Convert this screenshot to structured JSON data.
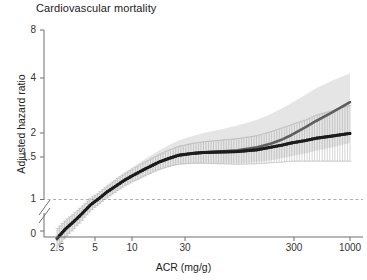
{
  "chart_data": {
    "type": "line",
    "title": "Cardiovascular mortality",
    "xlabel": "ACR (mg/g)",
    "ylabel": "Adjusted hazard ratio",
    "xscale": "log",
    "yscale": "log",
    "xlim": [
      2.0,
      1200
    ],
    "ylim": [
      0.45,
      8
    ],
    "xticks": [
      2.5,
      5,
      10,
      30,
      300,
      1000
    ],
    "xticklabels": [
      "2.5",
      "5",
      "10",
      "30",
      "300",
      "1000"
    ],
    "yticks": [
      0,
      1,
      1.5,
      2,
      4,
      8
    ],
    "yticklabels": [
      "0",
      "1",
      "1.5",
      "2",
      "4",
      "8"
    ],
    "axis_break": true,
    "grid": false,
    "reference_line": {
      "y": 1,
      "style": "dashed",
      "color": "#9a9a9a"
    },
    "legend": "none",
    "colors": {
      "primary_line": "#1c1c1c",
      "secondary_line": "#5e5e5e",
      "error_bars": "#9e9e9e",
      "confidence_band": "#dcdcdc",
      "axis": "#6f6f6f"
    },
    "x": [
      2.5,
      3,
      3.5,
      4,
      5,
      6,
      7,
      8,
      10,
      12,
      15,
      20,
      25,
      30,
      40,
      50,
      70,
      100,
      150,
      200,
      250,
      300,
      400,
      500,
      700,
      1000
    ],
    "series": [
      {
        "name": "Adjusted hazard ratio (primary)",
        "values": [
          0.62,
          0.7,
          0.76,
          0.82,
          0.94,
          1.02,
          1.1,
          1.16,
          1.27,
          1.35,
          1.45,
          1.58,
          1.66,
          1.72,
          1.76,
          1.78,
          1.79,
          1.8,
          1.84,
          1.9,
          1.95,
          2.0,
          2.06,
          2.12,
          2.18,
          2.25
        ],
        "ci_low": [
          0.55,
          0.63,
          0.69,
          0.75,
          0.87,
          0.95,
          1.02,
          1.08,
          1.18,
          1.25,
          1.33,
          1.44,
          1.5,
          1.54,
          1.56,
          1.56,
          1.55,
          1.54,
          1.55,
          1.57,
          1.58,
          1.6,
          1.6,
          1.6,
          1.6,
          1.6
        ],
        "ci_high": [
          0.7,
          0.78,
          0.84,
          0.9,
          1.02,
          1.1,
          1.18,
          1.25,
          1.37,
          1.46,
          1.58,
          1.73,
          1.84,
          1.92,
          1.99,
          2.03,
          2.07,
          2.11,
          2.19,
          2.3,
          2.41,
          2.5,
          2.65,
          2.81,
          2.98,
          3.17
        ]
      },
      {
        "name": "Adjusted hazard ratio (secondary)",
        "values": [
          0.62,
          0.7,
          0.76,
          0.82,
          0.94,
          1.02,
          1.1,
          1.16,
          1.27,
          1.35,
          1.45,
          1.58,
          1.66,
          1.72,
          1.76,
          1.78,
          1.8,
          1.83,
          1.9,
          1.99,
          2.09,
          2.2,
          2.42,
          2.62,
          2.92,
          3.3
        ]
      }
    ],
    "confidence_band": {
      "name": "95% CI band (secondary)",
      "low": [
        0.55,
        0.63,
        0.69,
        0.75,
        0.87,
        0.95,
        1.02,
        1.08,
        1.18,
        1.25,
        1.33,
        1.44,
        1.5,
        1.54,
        1.56,
        1.56,
        1.56,
        1.56,
        1.58,
        1.62,
        1.66,
        1.7,
        1.76,
        1.82,
        1.9,
        2.0
      ],
      "high": [
        0.7,
        0.78,
        0.84,
        0.9,
        1.02,
        1.1,
        1.19,
        1.27,
        1.4,
        1.5,
        1.64,
        1.82,
        1.96,
        2.06,
        2.18,
        2.26,
        2.36,
        2.48,
        2.66,
        2.86,
        3.06,
        3.26,
        3.6,
        3.92,
        4.3,
        4.7
      ]
    }
  }
}
